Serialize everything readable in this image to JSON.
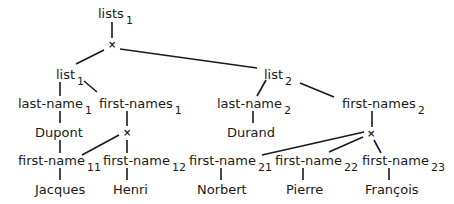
{
  "diagram": {
    "type": "tree",
    "cross_symbol": "×",
    "nodes": {
      "root": {
        "label": "lists",
        "sub": "1"
      },
      "list1": {
        "label": "list",
        "sub": "1"
      },
      "list2": {
        "label": "list",
        "sub": "2"
      },
      "last_name1": {
        "label": "last-name",
        "sub": "1"
      },
      "first_names1": {
        "label": "first-names",
        "sub": "1"
      },
      "last_name2": {
        "label": "last-name",
        "sub": "2"
      },
      "first_names2": {
        "label": "first-names",
        "sub": "2"
      },
      "dupont": {
        "label": "Dupont"
      },
      "durand": {
        "label": "Durand"
      },
      "first_name11": {
        "label": "first-name",
        "sub": "11"
      },
      "first_name12": {
        "label": "first-name",
        "sub": "12"
      },
      "first_name21": {
        "label": "first-name",
        "sub": "21"
      },
      "first_name22": {
        "label": "first-name",
        "sub": "22"
      },
      "first_name23": {
        "label": "first-name",
        "sub": "23"
      },
      "jacques": {
        "label": "Jacques"
      },
      "henri": {
        "label": "Henri"
      },
      "norbert": {
        "label": "Norbert"
      },
      "pierre": {
        "label": "Pierre"
      },
      "francois": {
        "label": "François"
      }
    }
  }
}
